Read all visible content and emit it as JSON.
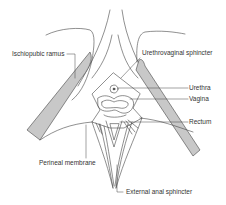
{
  "figure": {
    "type": "anatomical line diagram",
    "colors": {
      "line": "#444444",
      "bone_fill": "#c8c8c8",
      "background": "#ffffff"
    }
  },
  "labels": {
    "ischiopubic_ramus": "Ischiopubic ramus",
    "urethrovaginal_sphincter": "Urethrovaginal sphincter",
    "urethra": "Urethra",
    "vagina": "Vagina",
    "rectum": "Rectum",
    "perineal_membrane": "Perineal membrane",
    "external_anal_sphincter": "External anal sphincter"
  }
}
